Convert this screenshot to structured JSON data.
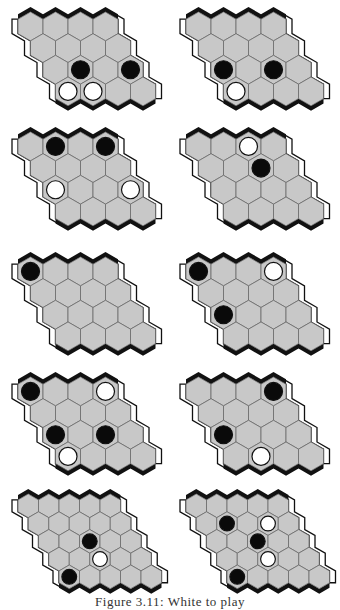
{
  "figure": {
    "caption": "Figure 3.11: White to play",
    "colors": {
      "cell_fill": "#c8c8c8",
      "cell_stroke": "#6a6a6a",
      "black_edge": "#111111",
      "white_edge_stroke": "#111111",
      "black_stone": "#0a0a0a",
      "white_stone": "#ffffff"
    },
    "boards": [
      {
        "id": 1,
        "size": 4,
        "x": 10,
        "y": 4,
        "stones": [
          {
            "r": 2,
            "c": 1,
            "color": "black"
          },
          {
            "r": 2,
            "c": 3,
            "color": "black"
          },
          {
            "r": 3,
            "c": 0,
            "color": "white"
          },
          {
            "r": 3,
            "c": 1,
            "color": "white"
          }
        ]
      },
      {
        "id": 2,
        "size": 4,
        "x": 178,
        "y": 4,
        "stones": [
          {
            "r": 2,
            "c": 0,
            "color": "black"
          },
          {
            "r": 2,
            "c": 2,
            "color": "black"
          },
          {
            "r": 3,
            "c": 0,
            "color": "white"
          }
        ]
      },
      {
        "id": 3,
        "size": 4,
        "x": 10,
        "y": 124,
        "stones": [
          {
            "r": 0,
            "c": 1,
            "color": "black"
          },
          {
            "r": 0,
            "c": 3,
            "color": "black"
          },
          {
            "r": 2,
            "c": 0,
            "color": "white"
          },
          {
            "r": 2,
            "c": 3,
            "color": "white"
          }
        ]
      },
      {
        "id": 4,
        "size": 4,
        "x": 178,
        "y": 124,
        "stones": [
          {
            "r": 0,
            "c": 2,
            "color": "white"
          },
          {
            "r": 1,
            "c": 2,
            "color": "black"
          }
        ]
      },
      {
        "id": 5,
        "size": 4,
        "x": 10,
        "y": 249,
        "stones": [
          {
            "r": 0,
            "c": 0,
            "color": "black"
          }
        ]
      },
      {
        "id": 6,
        "size": 4,
        "x": 178,
        "y": 249,
        "stones": [
          {
            "r": 0,
            "c": 0,
            "color": "black"
          },
          {
            "r": 0,
            "c": 3,
            "color": "white"
          },
          {
            "r": 2,
            "c": 0,
            "color": "black"
          }
        ]
      },
      {
        "id": 7,
        "size": 4,
        "x": 10,
        "y": 369,
        "stones": [
          {
            "r": 0,
            "c": 0,
            "color": "black"
          },
          {
            "r": 0,
            "c": 3,
            "color": "white"
          },
          {
            "r": 2,
            "c": 0,
            "color": "black"
          },
          {
            "r": 2,
            "c": 2,
            "color": "black"
          },
          {
            "r": 3,
            "c": 0,
            "color": "white"
          }
        ]
      },
      {
        "id": 8,
        "size": 4,
        "x": 178,
        "y": 369,
        "stones": [
          {
            "r": 0,
            "c": 3,
            "color": "black"
          },
          {
            "r": 2,
            "c": 0,
            "color": "black"
          },
          {
            "r": 3,
            "c": 1,
            "color": "white"
          }
        ]
      },
      {
        "id": 9,
        "size": 5,
        "x": 10,
        "y": 486,
        "stones": [
          {
            "r": 2,
            "c": 2,
            "color": "black"
          },
          {
            "r": 3,
            "c": 2,
            "color": "white"
          },
          {
            "r": 4,
            "c": 0,
            "color": "black"
          }
        ]
      },
      {
        "id": 10,
        "size": 5,
        "x": 178,
        "y": 486,
        "stones": [
          {
            "r": 1,
            "c": 1,
            "color": "black"
          },
          {
            "r": 1,
            "c": 3,
            "color": "white"
          },
          {
            "r": 2,
            "c": 2,
            "color": "black"
          },
          {
            "r": 3,
            "c": 2,
            "color": "white"
          },
          {
            "r": 4,
            "c": 0,
            "color": "black"
          }
        ]
      }
    ]
  }
}
